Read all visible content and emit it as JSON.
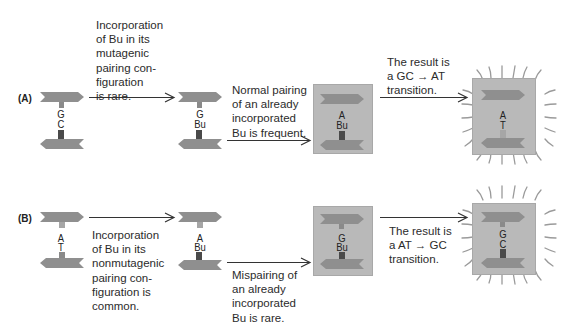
{
  "rows": {
    "A": {
      "label": "(A)",
      "step1": {
        "top_base": "G",
        "bottom_base": "C",
        "top_link_color": "#8a8a8a",
        "bottom_link_color": "#4a4a4a"
      },
      "arrow1_text": "Incorporation\nof Bu in its\nmutagenic\npairing con-\nfiguration\nis rare.",
      "step2": {
        "top_base": "G",
        "bottom_base": "Bu"
      },
      "arrow2_text": "Normal pairing\nof an already\nincorporated\nBu is frequent.",
      "step3": {
        "top_base": "A",
        "bottom_base": "Bu"
      },
      "arrow3_text": "The result is\na GC → AT\ntransition.",
      "step4": {
        "top_base": "A",
        "bottom_base": "T"
      }
    },
    "B": {
      "label": "(B)",
      "step1": {
        "top_base": "A",
        "bottom_base": "T"
      },
      "arrow1_text": "Incorporation\nof Bu in its\nnonmutagenic\npairing con-\nfiguration is\ncommon.",
      "step2": {
        "top_base": "A",
        "bottom_base": "Bu"
      },
      "arrow2_text": "Mispairing of\nan already\nincorporated\nBu is rare.",
      "step3": {
        "top_base": "G",
        "bottom_base": "Bu"
      },
      "arrow3_text": "The result is\na AT → GC\ntransition.",
      "step4": {
        "top_base": "G",
        "bottom_base": "C"
      }
    }
  },
  "colors": {
    "strand": "#8f8f8f",
    "box": "#b9b9b9",
    "light_link": "#a6a6a6",
    "dark_link": "#4d4d4d",
    "arrow": "#333333",
    "rays": "#9a9a9a"
  }
}
